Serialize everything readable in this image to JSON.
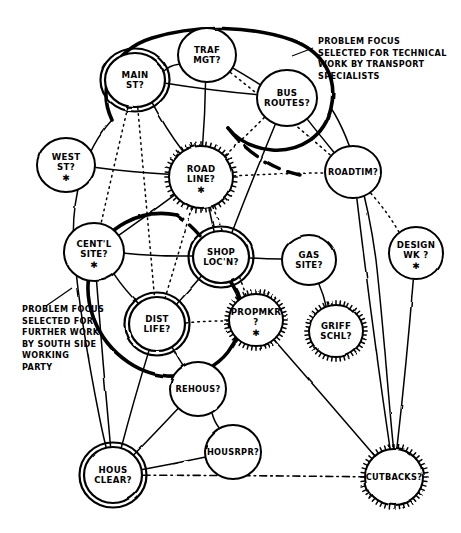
{
  "diagram": {
    "style": {
      "ink": "#000000",
      "paper": "#ffffff"
    },
    "nodes": [
      {
        "id": "main-st",
        "label_lines": [
          "MAIN",
          "ST?"
        ],
        "x": 135,
        "y": 80,
        "rx": 30,
        "ry": 27,
        "border": "double",
        "star": false
      },
      {
        "id": "traf-mgt",
        "label_lines": [
          "TRAF",
          "MGT?"
        ],
        "x": 207,
        "y": 55,
        "rx": 29,
        "ry": 27,
        "border": "single",
        "star": false
      },
      {
        "id": "bus-routes",
        "label_lines": [
          "BUS",
          "ROUTES?"
        ],
        "x": 287,
        "y": 98,
        "rx": 30,
        "ry": 28,
        "border": "single",
        "star": false
      },
      {
        "id": "west-st",
        "label_lines": [
          "WEST",
          "ST?"
        ],
        "x": 66,
        "y": 165,
        "rx": 29,
        "ry": 27,
        "border": "single",
        "star": true
      },
      {
        "id": "road-line",
        "label_lines": [
          "ROAD",
          "LINE?"
        ],
        "x": 201,
        "y": 177,
        "rx": 32,
        "ry": 31,
        "border": "spiky",
        "star": true
      },
      {
        "id": "roadtim",
        "label_lines": [
          "ROADTIM?"
        ],
        "x": 353,
        "y": 172,
        "rx": 28,
        "ry": 26,
        "border": "single",
        "star": false
      },
      {
        "id": "centl-site",
        "label_lines": [
          "CENT'L",
          "SITE?"
        ],
        "x": 94,
        "y": 252,
        "rx": 30,
        "ry": 29,
        "border": "single",
        "star": true
      },
      {
        "id": "shop-locn",
        "label_lines": [
          "SHOP",
          "LOC'N?"
        ],
        "x": 221,
        "y": 257,
        "rx": 28,
        "ry": 26,
        "border": "double",
        "star": false
      },
      {
        "id": "gas-site",
        "label_lines": [
          "GAS",
          "SITE?"
        ],
        "x": 309,
        "y": 260,
        "rx": 27,
        "ry": 25,
        "border": "single",
        "star": false
      },
      {
        "id": "design-wk",
        "label_lines": [
          "DESIGN",
          "WK ?"
        ],
        "x": 416,
        "y": 253,
        "rx": 27,
        "ry": 26,
        "border": "single",
        "star": true
      },
      {
        "id": "propmkr",
        "label_lines": [
          "PROPMKR",
          "?"
        ],
        "x": 256,
        "y": 320,
        "rx": 27,
        "ry": 26,
        "border": "spiky",
        "star": true
      },
      {
        "id": "griff-schl",
        "label_lines": [
          "GRIFF",
          "SCHL?"
        ],
        "x": 336,
        "y": 331,
        "rx": 27,
        "ry": 26,
        "border": "spiky",
        "star": false
      },
      {
        "id": "dist-life",
        "label_lines": [
          "DIST",
          "LIFE?"
        ],
        "x": 157,
        "y": 324,
        "rx": 28,
        "ry": 27,
        "border": "double",
        "star": false
      },
      {
        "id": "rehous",
        "label_lines": [
          "REHOUS?"
        ],
        "x": 198,
        "y": 389,
        "rx": 28,
        "ry": 27,
        "border": "single",
        "star": false
      },
      {
        "id": "housrpr",
        "label_lines": [
          "HOUSRPR?"
        ],
        "x": 233,
        "y": 452,
        "rx": 28,
        "ry": 27,
        "border": "single",
        "star": false
      },
      {
        "id": "hous-clear",
        "label_lines": [
          "HOUS",
          "CLEAR?"
        ],
        "x": 113,
        "y": 475,
        "rx": 29,
        "ry": 28,
        "border": "double",
        "star": false
      },
      {
        "id": "cutbacks",
        "label_lines": [
          "CUTBACKS?"
        ],
        "x": 394,
        "y": 477,
        "rx": 29,
        "ry": 28,
        "border": "spiky",
        "star": false
      }
    ],
    "links": [
      {
        "from": "main-st",
        "to": "traf-mgt",
        "style": "solid"
      },
      {
        "from": "main-st",
        "to": "road-line",
        "style": "solid"
      },
      {
        "from": "main-st",
        "to": "bus-routes",
        "style": "solid"
      },
      {
        "from": "main-st",
        "to": "centl-site",
        "style": "dotted"
      },
      {
        "from": "main-st",
        "to": "dist-life",
        "style": "dotted"
      },
      {
        "from": "traf-mgt",
        "to": "bus-routes",
        "style": "solid"
      },
      {
        "from": "traf-mgt",
        "to": "road-line",
        "style": "solid"
      },
      {
        "from": "traf-mgt",
        "to": "roadtim",
        "style": "dotted"
      },
      {
        "from": "bus-routes",
        "to": "road-line",
        "style": "dotted"
      },
      {
        "from": "bus-routes",
        "to": "roadtim",
        "style": "solid"
      },
      {
        "from": "bus-routes",
        "to": "shop-locn",
        "style": "solid"
      },
      {
        "from": "west-st",
        "to": "road-line",
        "style": "solid"
      },
      {
        "from": "road-line",
        "to": "centl-site",
        "style": "solid"
      },
      {
        "from": "road-line",
        "to": "shop-locn",
        "style": "solid"
      },
      {
        "from": "road-line",
        "to": "dist-life",
        "style": "dotted"
      },
      {
        "from": "road-line",
        "to": "propmkr",
        "style": "dotted"
      },
      {
        "from": "road-line",
        "to": "roadtim",
        "style": "dotted"
      },
      {
        "from": "roadtim",
        "to": "design-wk",
        "style": "dotted"
      },
      {
        "from": "roadtim",
        "to": "cutbacks",
        "style": "solid"
      },
      {
        "from": "centl-site",
        "to": "shop-locn",
        "style": "solid"
      },
      {
        "from": "centl-site",
        "to": "dist-life",
        "style": "solid"
      },
      {
        "from": "centl-site",
        "to": "hous-clear",
        "style": "solid"
      },
      {
        "from": "shop-locn",
        "to": "gas-site",
        "style": "solid"
      },
      {
        "from": "shop-locn",
        "to": "dist-life",
        "style": "solid"
      },
      {
        "from": "gas-site",
        "to": "griff-schl",
        "style": "solid"
      },
      {
        "from": "design-wk",
        "to": "cutbacks",
        "style": "solid"
      },
      {
        "from": "dist-life",
        "to": "propmkr",
        "style": "dotted"
      },
      {
        "from": "dist-life",
        "to": "rehous",
        "style": "solid"
      },
      {
        "from": "dist-life",
        "to": "hous-clear",
        "style": "solid"
      },
      {
        "from": "rehous",
        "to": "housrpr",
        "style": "solid"
      },
      {
        "from": "rehous",
        "to": "hous-clear",
        "style": "solid"
      },
      {
        "from": "housrpr",
        "to": "hous-clear",
        "style": "solid"
      },
      {
        "from": "propmkr",
        "to": "cutbacks",
        "style": "solid"
      },
      {
        "from": "hous-clear",
        "to": "cutbacks",
        "style": "dashdot"
      }
    ],
    "annotations": [
      {
        "id": "technical-work-note",
        "lines": [
          "PROBLEM FOCUS",
          "SELECTED FOR TECHNICAL",
          "WORK BY TRANSPORT",
          "SPECIALISTS"
        ],
        "x": 318,
        "y": 44
      },
      {
        "id": "south-side-note",
        "lines": [
          "PROBLEM FOCUS",
          "SELECTED FOR",
          "FURTHER WORK",
          "BY SOUTH SIDE",
          "WORKING",
          "PARTY"
        ],
        "x": 22,
        "y": 312
      }
    ],
    "clusters": [
      {
        "id": "transport-cluster",
        "label_ref": "technical-work-note"
      },
      {
        "id": "south-side-cluster",
        "label_ref": "south-side-note"
      }
    ]
  }
}
